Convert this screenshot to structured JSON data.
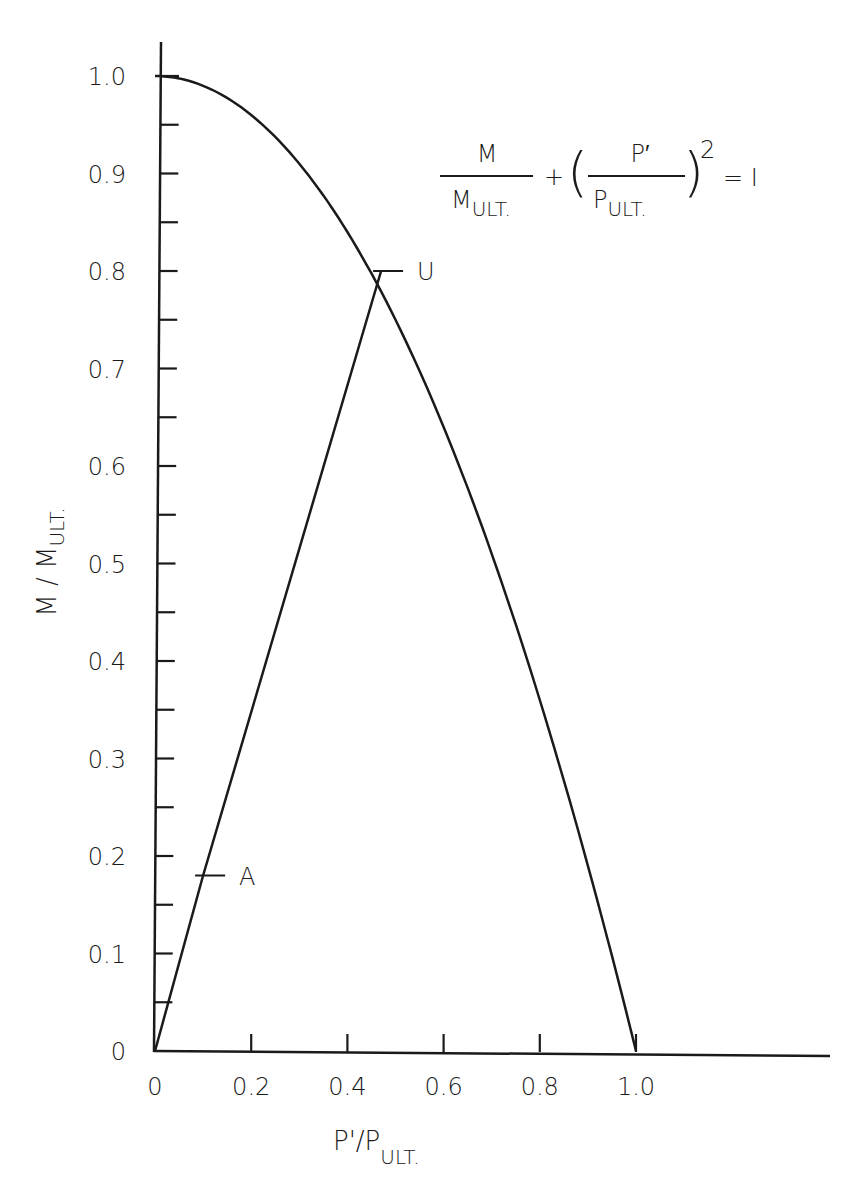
{
  "chart_data": {
    "type": "line",
    "title": "",
    "xlabel": "P'/P_ULT.",
    "xlabel_main": "P'/P",
    "xlabel_sub": "ULT.",
    "ylabel": "M / M_ULT.",
    "ylabel_main": "M / M",
    "ylabel_sub": "ULT.",
    "xlim": [
      0,
      1.4
    ],
    "ylim": [
      0,
      1.05
    ],
    "grid": false,
    "x_ticks": [
      0,
      0.2,
      0.4,
      0.6,
      0.8,
      1.0
    ],
    "x_tick_labels": [
      "0",
      "0.2",
      "0.4",
      "0.6",
      "0.8",
      "1.0"
    ],
    "y_ticks": [
      0,
      0.1,
      0.2,
      0.3,
      0.4,
      0.5,
      0.6,
      0.7,
      0.8,
      0.9,
      1.0
    ],
    "y_tick_labels": [
      "0",
      "0.1",
      "0.2",
      "0.3",
      "0.4",
      "0.5",
      "0.6",
      "0.7",
      "0.8",
      "0.9",
      "1.0"
    ],
    "y_minor_ticks": [
      0.05,
      0.15,
      0.25,
      0.35,
      0.45,
      0.55,
      0.65,
      0.75,
      0.85,
      0.95
    ],
    "series": [
      {
        "name": "Interaction curve M/M_ULT + (P'/P_ULT)^2 = 1",
        "type": "curve",
        "x": [
          0,
          0.1,
          0.2,
          0.3,
          0.4,
          0.47,
          0.5,
          0.6,
          0.7,
          0.8,
          0.9,
          1.0
        ],
        "y": [
          1.0,
          0.99,
          0.96,
          0.91,
          0.84,
          0.78,
          0.75,
          0.64,
          0.51,
          0.36,
          0.19,
          0
        ]
      },
      {
        "name": "Loading path O-A-U",
        "type": "line",
        "x": [
          0,
          0.1,
          0.47
        ],
        "y": [
          0,
          0.18,
          0.8
        ]
      }
    ],
    "annotations": [
      {
        "label": "U",
        "x": 0.47,
        "y": 0.8
      },
      {
        "label": "A",
        "x": 0.1,
        "y": 0.18
      }
    ],
    "equation": {
      "text": "M/M_ULT. + (P'/P_ULT.)^2 = 1",
      "term1_num": "M",
      "term1_den_main": "M",
      "term1_den_sub": "ULT.",
      "plus": "+",
      "term2_num": "P′",
      "term2_den_main": "P",
      "term2_den_sub": "ULT.",
      "exponent": "2",
      "equals": "= I"
    }
  }
}
